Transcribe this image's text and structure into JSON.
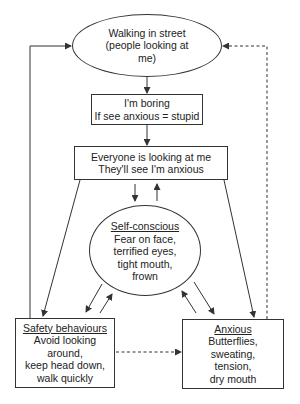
{
  "diagram": {
    "nodes": {
      "walking": {
        "lines": [
          "Walking in street",
          "(people looking at",
          "me)"
        ]
      },
      "boring": {
        "lines": [
          "I'm boring",
          "If see anxious = stupid"
        ]
      },
      "everyone": {
        "lines": [
          "Everyone is looking at me",
          "They'll see I'm anxious"
        ]
      },
      "self_conscious": {
        "title": "Self-conscious",
        "lines": [
          "Fear on face,",
          "terrified eyes,",
          "tight mouth,",
          "frown"
        ]
      },
      "safety": {
        "title": "Safety behaviours",
        "lines": [
          "Avoid looking",
          "around,",
          "keep head down,",
          "walk quickly"
        ]
      },
      "anxious": {
        "title": "Anxious",
        "lines": [
          "Butterflies,",
          "sweating,",
          "tension,",
          "dry mouth"
        ]
      }
    },
    "edges": [
      {
        "from": "walking",
        "to": "boring",
        "style": "solid"
      },
      {
        "from": "boring",
        "to": "everyone",
        "style": "solid"
      },
      {
        "from": "everyone",
        "to": "self_conscious",
        "style": "solid"
      },
      {
        "from": "self_conscious",
        "to": "everyone",
        "style": "solid"
      },
      {
        "from": "everyone",
        "to": "safety",
        "style": "solid"
      },
      {
        "from": "everyone",
        "to": "anxious",
        "style": "solid"
      },
      {
        "from": "self_conscious",
        "to": "safety",
        "style": "solid"
      },
      {
        "from": "safety",
        "to": "self_conscious",
        "style": "solid"
      },
      {
        "from": "self_conscious",
        "to": "anxious",
        "style": "solid"
      },
      {
        "from": "anxious",
        "to": "self_conscious",
        "style": "solid"
      },
      {
        "from": "safety",
        "to": "walking",
        "style": "solid"
      },
      {
        "from": "anxious",
        "to": "walking",
        "style": "dashed"
      },
      {
        "from": "safety",
        "to": "anxious",
        "style": "dashed"
      }
    ],
    "colors": {
      "stroke": "#333333",
      "text": "#222222",
      "background": "#ffffff"
    }
  }
}
